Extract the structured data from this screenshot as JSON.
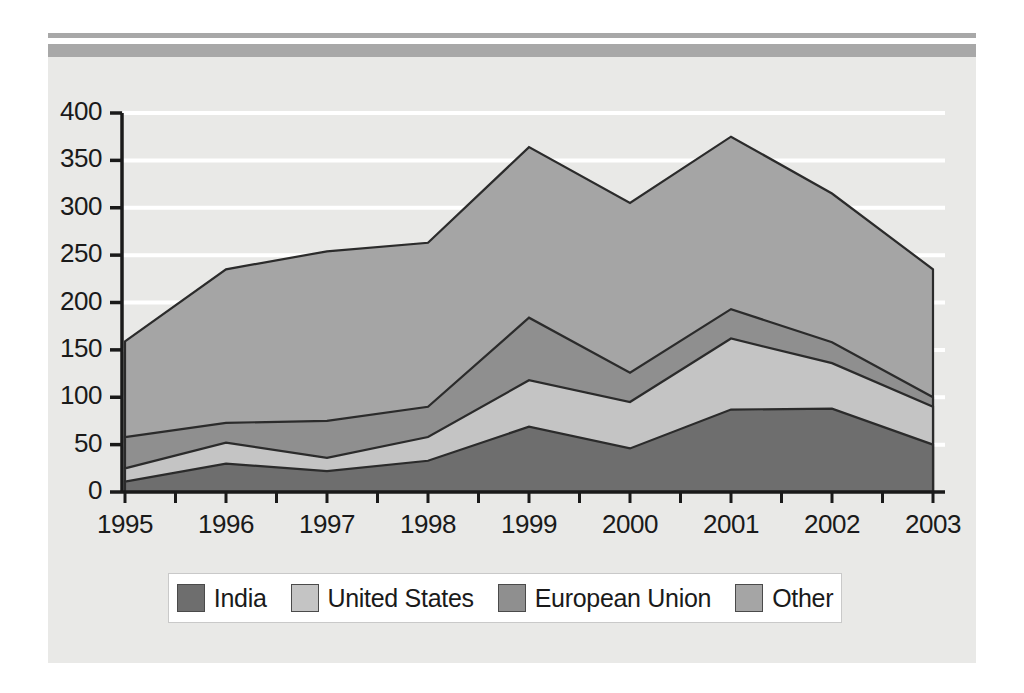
{
  "chart_data": {
    "type": "area",
    "stacked": true,
    "title": "",
    "subtitle": "",
    "xlabel": "",
    "ylabel": "",
    "categories": [
      "1995",
      "1996",
      "1997",
      "1998",
      "1999",
      "2000",
      "2001",
      "2002",
      "2003"
    ],
    "x": [
      1995,
      1996,
      1997,
      1998,
      1999,
      2000,
      2001,
      2002,
      2003
    ],
    "series": [
      {
        "name": "India",
        "color": "#6e6e6e",
        "values": [
          11,
          30,
          22,
          33,
          69,
          46,
          87,
          88,
          50
        ]
      },
      {
        "name": "United States",
        "color": "#c4c4c4",
        "values": [
          14,
          22,
          14,
          25,
          49,
          49,
          75,
          48,
          40
        ]
      },
      {
        "name": "European Union",
        "color": "#8f8f8f",
        "values": [
          33,
          21,
          39,
          32,
          66,
          31,
          31,
          22,
          10
        ]
      },
      {
        "name": "Other",
        "color": "#a5a5a5",
        "values": [
          101,
          162,
          179,
          173,
          180,
          179,
          182,
          157,
          135
        ]
      }
    ],
    "cumulative_tops": {
      "India": [
        11,
        30,
        22,
        33,
        69,
        46,
        87,
        88,
        50
      ],
      "United States": [
        25,
        52,
        36,
        58,
        118,
        95,
        162,
        136,
        90
      ],
      "European Union": [
        58,
        73,
        75,
        90,
        184,
        126,
        193,
        158,
        100
      ],
      "Other": [
        159,
        235,
        254,
        263,
        364,
        305,
        375,
        315,
        235
      ]
    },
    "ylim": [
      0,
      400
    ],
    "yticks": [
      0,
      50,
      100,
      150,
      200,
      250,
      300,
      350,
      400
    ],
    "ytick_labels": [
      "0",
      "50",
      "100",
      "150",
      "200",
      "250",
      "300",
      "350",
      "400"
    ],
    "xtick_labels": [
      "1995",
      "1996",
      "1997",
      "1998",
      "1999",
      "2000",
      "2001",
      "2002",
      "2003"
    ],
    "grid": true,
    "grid_color": "#ffffff",
    "legend_position": "bottom",
    "legend_entries": [
      "India",
      "United States",
      "European Union",
      "Other"
    ],
    "background": "#e9e9e7",
    "axis_color": "#1a1a1a"
  },
  "legend": {
    "items": [
      {
        "label": "India",
        "swatch": "#6e6e6e"
      },
      {
        "label": "United States",
        "swatch": "#c4c4c4"
      },
      {
        "label": "European Union",
        "swatch": "#8f8f8f"
      },
      {
        "label": "Other",
        "swatch": "#a5a5a5"
      }
    ]
  },
  "axes": {
    "y_labels": [
      "400",
      "350",
      "300",
      "250",
      "200",
      "150",
      "100",
      "50",
      "0"
    ],
    "x_labels": [
      "1995",
      "1996",
      "1997",
      "1998",
      "1999",
      "2000",
      "2001",
      "2002",
      "2003"
    ]
  }
}
